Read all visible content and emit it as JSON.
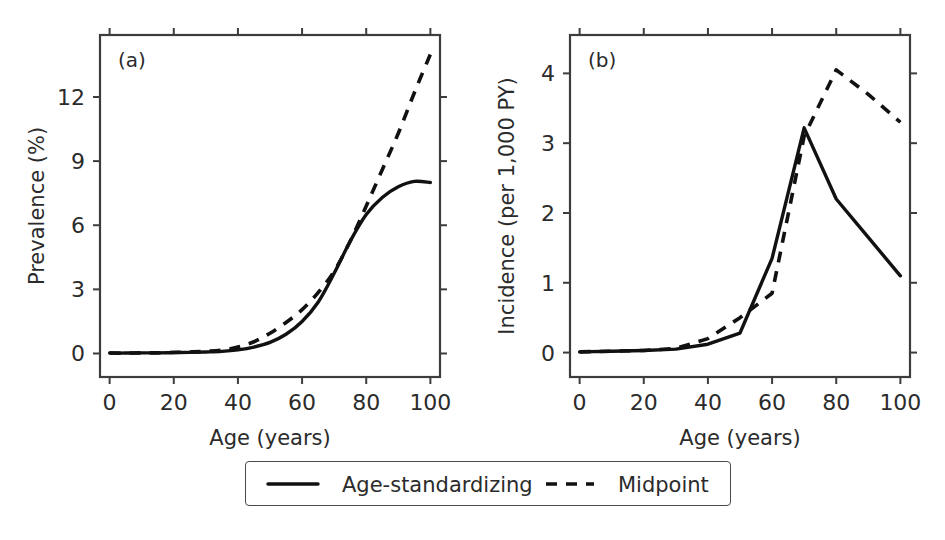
{
  "figure": {
    "background": "#ffffff",
    "line_color": "#111111",
    "axis_color": "#3d3d3d"
  },
  "legend": {
    "position": "below-panels-center",
    "entries": [
      {
        "label": "Age-standardizing",
        "style": "solid",
        "swatch": "solid-line-swatch"
      },
      {
        "label": "Midpoint",
        "style": "dashed",
        "swatch": "dashed-line-swatch"
      }
    ]
  },
  "chart_data": [
    {
      "type": "line",
      "panel_tag": "(a)",
      "title": "",
      "xlabel": "Age (years)",
      "ylabel": "Prevalence (%)",
      "xlim": [
        -3,
        103
      ],
      "ylim": [
        -1.1,
        14.9
      ],
      "xticks": [
        0,
        20,
        40,
        60,
        80,
        100
      ],
      "yticks": [
        0,
        3,
        6,
        9,
        12
      ],
      "xticklabels": [
        "0",
        "20",
        "40",
        "60",
        "80",
        "100"
      ],
      "yticklabels": [
        "0",
        "3",
        "6",
        "9",
        "12"
      ],
      "grid": false,
      "x": [
        0,
        5,
        10,
        15,
        20,
        25,
        30,
        35,
        40,
        45,
        50,
        55,
        60,
        65,
        70,
        75,
        80,
        85,
        90,
        95,
        100
      ],
      "series": [
        {
          "name": "Age-standardizing",
          "style": "solid",
          "values": [
            0.02,
            0.02,
            0.03,
            0.03,
            0.04,
            0.05,
            0.07,
            0.1,
            0.17,
            0.3,
            0.52,
            0.9,
            1.5,
            2.4,
            3.75,
            5.25,
            6.5,
            7.3,
            7.8,
            8.05,
            8.0
          ]
        },
        {
          "name": "Midpoint",
          "style": "dashed",
          "values": [
            0.02,
            0.02,
            0.03,
            0.03,
            0.05,
            0.07,
            0.1,
            0.16,
            0.3,
            0.55,
            0.95,
            1.45,
            2.05,
            2.85,
            3.85,
            5.25,
            6.9,
            8.6,
            10.3,
            12.2,
            14.0
          ]
        }
      ]
    },
    {
      "type": "line",
      "panel_tag": "(b)",
      "title": "",
      "xlabel": "Age (years)",
      "ylabel": "Incidence (per 1,000 PY)",
      "xlim": [
        -3,
        103
      ],
      "ylim": [
        -0.35,
        4.55
      ],
      "xticks": [
        0,
        20,
        40,
        60,
        80,
        100
      ],
      "yticks": [
        0,
        1,
        2,
        3,
        4
      ],
      "xticklabels": [
        "0",
        "20",
        "40",
        "60",
        "80",
        "100"
      ],
      "yticklabels": [
        "0",
        "1",
        "2",
        "3",
        "4"
      ],
      "grid": false,
      "x": [
        0,
        10,
        20,
        30,
        40,
        50,
        60,
        70,
        80,
        90,
        100
      ],
      "series": [
        {
          "name": "Age-standardizing",
          "style": "solid",
          "values": [
            0.01,
            0.02,
            0.03,
            0.05,
            0.12,
            0.28,
            1.35,
            3.22,
            2.2,
            1.65,
            1.1
          ]
        },
        {
          "name": "Midpoint",
          "style": "dashed",
          "values": [
            0.01,
            0.02,
            0.03,
            0.06,
            0.2,
            0.5,
            0.85,
            3.1,
            4.05,
            3.7,
            3.3
          ]
        }
      ]
    }
  ]
}
